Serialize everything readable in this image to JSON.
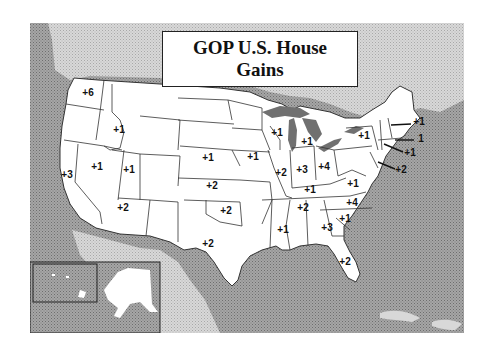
{
  "title": {
    "line1": "GOP U.S. House",
    "line2": "Gains"
  },
  "colors": {
    "ocean": "#8c8c8c",
    "foreign_land": "#c8c8c8",
    "us_land": "#ffffff",
    "lakes": "#707070",
    "border": "#333333"
  },
  "states": [
    {
      "state": "Washington",
      "label": "+6",
      "x": 88,
      "y": 93
    },
    {
      "state": "Idaho",
      "label": "+1",
      "x": 119,
      "y": 130
    },
    {
      "state": "California",
      "label": "+3",
      "x": 67,
      "y": 175
    },
    {
      "state": "Nevada",
      "label": "+1",
      "x": 97,
      "y": 167
    },
    {
      "state": "Utah",
      "label": "+1",
      "x": 129,
      "y": 170
    },
    {
      "state": "Arizona",
      "label": "+2",
      "x": 123,
      "y": 208
    },
    {
      "state": "Nebraska",
      "label": "+1",
      "x": 208,
      "y": 158
    },
    {
      "state": "Kansas",
      "label": "+2",
      "x": 212,
      "y": 186
    },
    {
      "state": "Oklahoma",
      "label": "+2",
      "x": 226,
      "y": 211
    },
    {
      "state": "Texas",
      "label": "+2",
      "x": 208,
      "y": 244
    },
    {
      "state": "Iowa",
      "label": "+1",
      "x": 253,
      "y": 157
    },
    {
      "state": "Wisconsin",
      "label": "+1",
      "x": 277,
      "y": 133
    },
    {
      "state": "Michigan",
      "label": "+1",
      "x": 307,
      "y": 142
    },
    {
      "state": "Illinois",
      "label": "+2",
      "x": 281,
      "y": 173
    },
    {
      "state": "Indiana",
      "label": "+3",
      "x": 302,
      "y": 170
    },
    {
      "state": "Ohio",
      "label": "+4",
      "x": 324,
      "y": 167
    },
    {
      "state": "Kentucky",
      "label": "+1",
      "x": 310,
      "y": 190
    },
    {
      "state": "Tennessee",
      "label": "+2",
      "x": 303,
      "y": 208
    },
    {
      "state": "Mississippi",
      "label": "+1",
      "x": 283,
      "y": 230
    },
    {
      "state": "Georgia",
      "label": "+3",
      "x": 327,
      "y": 228
    },
    {
      "state": "South Carolina",
      "label": "+1",
      "x": 345,
      "y": 219
    },
    {
      "state": "North Carolina",
      "label": "+4",
      "x": 352,
      "y": 203
    },
    {
      "state": "Virginia",
      "label": "+1",
      "x": 353,
      "y": 184
    },
    {
      "state": "Florida",
      "label": "+2",
      "x": 345,
      "y": 262
    },
    {
      "state": "New York",
      "label": "+1",
      "x": 364,
      "y": 136
    }
  ],
  "callouts": [
    {
      "state": "New Hampshire",
      "label": "+1",
      "x": 419,
      "y": 122,
      "line": [
        391,
        125,
        411,
        124
      ]
    },
    {
      "state": "Massachusetts",
      "label": "1",
      "x": 421,
      "y": 139,
      "line": [
        395,
        140,
        414,
        140
      ]
    },
    {
      "state": "Connecticut",
      "label": "+1",
      "x": 410,
      "y": 153,
      "line": [
        384,
        144,
        403,
        152
      ]
    },
    {
      "state": "New Jersey",
      "label": "+2",
      "x": 401,
      "y": 170,
      "line": [
        378,
        162,
        395,
        169
      ]
    }
  ],
  "inset": {
    "name": "Alaska & Hawaii inset"
  }
}
